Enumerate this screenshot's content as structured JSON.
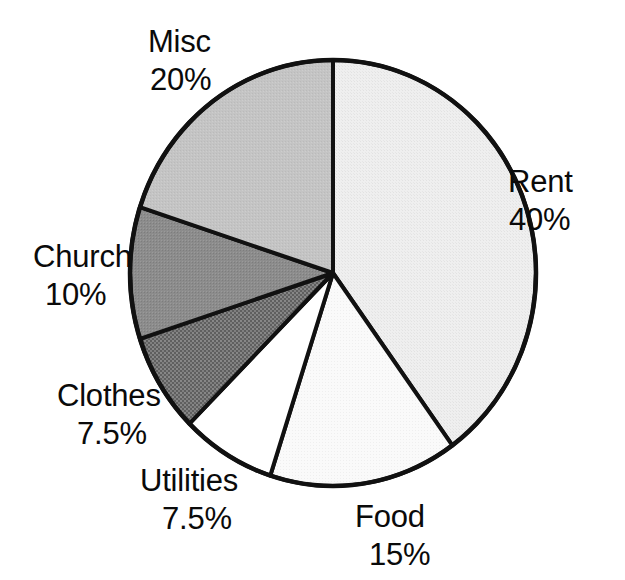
{
  "chart_data": {
    "type": "pie",
    "title": "",
    "subtitle": "",
    "xlabel": "",
    "ylabel": "",
    "legend_position": "none",
    "grid": false,
    "labels_outside": true,
    "start_angle_deg": 90,
    "direction": "clockwise",
    "categories": [
      "Rent",
      "Food",
      "Utilities",
      "Clothes",
      "Church",
      "Misc"
    ],
    "values": [
      40,
      15,
      7.5,
      7.5,
      10,
      20
    ],
    "value_unit": "%",
    "slices": [
      {
        "name": "Rent",
        "value": 40,
        "value_text": "40%",
        "fill": "#ededed",
        "sweep_deg": 144,
        "start_deg": 0,
        "end_deg": 144,
        "pattern": "fine-light-stipple"
      },
      {
        "name": "Food",
        "value": 15,
        "value_text": "15%",
        "fill": "#f7f7f7",
        "sweep_deg": 54,
        "start_deg": 144,
        "end_deg": 198,
        "pattern": "very-fine-stipple"
      },
      {
        "name": "Utilities",
        "value": 7.5,
        "value_text": "7.5%",
        "fill": "#ffffff",
        "sweep_deg": 27,
        "start_deg": 198,
        "end_deg": 225,
        "pattern": "none"
      },
      {
        "name": "Clothes",
        "value": 7.5,
        "value_text": "7.5%",
        "fill": "#6d6d6d",
        "sweep_deg": 27,
        "start_deg": 225,
        "end_deg": 252,
        "pattern": "dark-dotted"
      },
      {
        "name": "Church",
        "value": 10,
        "value_text": "10%",
        "fill": "#8c8c8c",
        "sweep_deg": 36,
        "start_deg": 252,
        "end_deg": 288,
        "pattern": "medium-gray-noise"
      },
      {
        "name": "Misc",
        "value": 20,
        "value_text": "20%",
        "fill": "#c2c2c2",
        "sweep_deg": 72,
        "start_deg": 288,
        "end_deg": 360,
        "pattern": "light-gray-noise"
      }
    ],
    "outline_color": "#111111",
    "background_color": "#ffffff"
  },
  "labels": {
    "misc": {
      "name": "Misc",
      "value": "20%"
    },
    "rent": {
      "name": "Rent",
      "value": "40%"
    },
    "church": {
      "name": "Church",
      "value": "10%"
    },
    "clothes": {
      "name": "Clothes",
      "value": "7.5%"
    },
    "utilities": {
      "name": "Utilities",
      "value": "7.5%"
    },
    "food": {
      "name": "Food",
      "value": "15%"
    }
  }
}
